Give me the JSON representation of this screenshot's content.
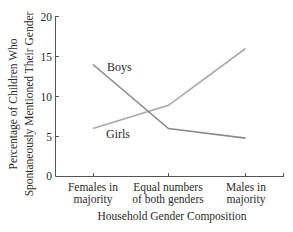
{
  "chart_data": {
    "type": "line",
    "title": "",
    "xlabel": "Household Gender Composition",
    "ylabel": [
      "Percentage of Children Who",
      "Spontaneously Mentioned Their Gender"
    ],
    "ylim": [
      0,
      20
    ],
    "yticks": [
      0,
      5,
      10,
      15,
      20
    ],
    "grid": false,
    "legend": "inline labels on lines",
    "categories": [
      [
        "Females in",
        "majority"
      ],
      [
        "Equal numbers",
        "of both genders"
      ],
      [
        "Males in",
        "majority"
      ]
    ],
    "series": [
      {
        "name": "Boys",
        "values": [
          14,
          6,
          4.8
        ],
        "color": "#8a8a8a"
      },
      {
        "name": "Girls",
        "values": [
          6,
          8.9,
          16
        ],
        "color": "#a8a8a8"
      }
    ]
  },
  "labels": {
    "boys": "Boys",
    "girls": "Girls",
    "xlabel": "Household Gender Composition",
    "ylabel_line1": "Percentage of Children Who",
    "ylabel_line2": "Spontaneously Mentioned Their Gender",
    "ytick_0": "0",
    "ytick_5": "5",
    "ytick_10": "10",
    "ytick_15": "15",
    "ytick_20": "20",
    "cat1_l1": "Females in",
    "cat1_l2": "majority",
    "cat2_l1": "Equal numbers",
    "cat2_l2": "of both genders",
    "cat3_l1": "Males in",
    "cat3_l2": "majority"
  }
}
